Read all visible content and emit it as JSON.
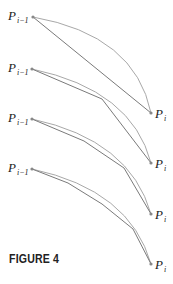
{
  "figure": {
    "caption": "FIGURE 4",
    "label_start": "P",
    "label_start_sub": "i−1",
    "label_end": "P",
    "label_end_sub": "i",
    "colors": {
      "arc": "#a8a8a8",
      "chord": "#7a7a7a",
      "point": "#888888",
      "text": "#222222"
    },
    "panels": [
      {
        "n_segments": 1,
        "start": [
          33,
          17
        ],
        "end": [
          151,
          113
        ],
        "arc_ctrl": [
          135,
          35
        ],
        "vertices": [
          [
            33,
            17
          ],
          [
            151,
            113
          ]
        ]
      },
      {
        "n_segments": 2,
        "start": [
          32,
          69
        ],
        "end": [
          151,
          163
        ],
        "arc_ctrl": [
          132,
          90
        ],
        "vertices": [
          [
            32,
            69
          ],
          [
            102,
            99
          ],
          [
            151,
            163
          ]
        ]
      },
      {
        "n_segments": 3,
        "start": [
          32,
          119
        ],
        "end": [
          151,
          214
        ],
        "arc_ctrl": [
          130,
          140
        ],
        "vertices": [
          [
            32,
            119
          ],
          [
            84,
            141
          ],
          [
            124,
            168
          ],
          [
            151,
            214
          ]
        ]
      },
      {
        "n_segments": 4,
        "start": [
          32,
          169
        ],
        "end": [
          151,
          264
        ],
        "arc_ctrl": [
          130,
          190
        ],
        "vertices": [
          [
            32,
            169
          ],
          [
            68,
            183
          ],
          [
            102,
            204
          ],
          [
            133,
            229
          ],
          [
            151,
            264
          ]
        ]
      }
    ]
  }
}
